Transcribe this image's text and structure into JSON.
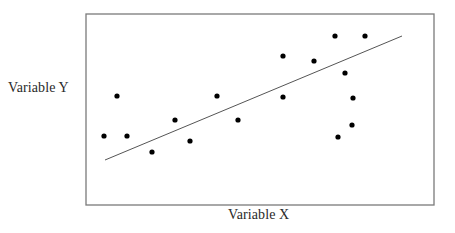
{
  "chart_data": {
    "type": "scatter",
    "title": "",
    "xlabel": "Variable X",
    "ylabel": "Variable Y",
    "xlim": [
      0,
      100
    ],
    "ylim": [
      0,
      100
    ],
    "grid": false,
    "legend": null,
    "ticks": "none",
    "series": [
      {
        "name": "observations",
        "marker": "filled-circle",
        "color": "#000000",
        "points_px": [
          [
            104,
            136
          ],
          [
            117,
            96
          ],
          [
            127,
            136
          ],
          [
            152,
            152
          ],
          [
            175,
            120
          ],
          [
            190,
            141
          ],
          [
            217,
            96
          ],
          [
            238,
            120
          ],
          [
            283,
            56
          ],
          [
            283,
            97
          ],
          [
            314,
            61
          ],
          [
            335,
            36
          ],
          [
            345,
            73
          ],
          [
            365,
            36
          ],
          [
            353,
            98
          ],
          [
            352,
            125
          ],
          [
            338,
            137
          ]
        ],
        "points": [
          {
            "x": 5,
            "y": 36
          },
          {
            "x": 9,
            "y": 57
          },
          {
            "x": 12,
            "y": 36
          },
          {
            "x": 19,
            "y": 28
          },
          {
            "x": 26,
            "y": 45
          },
          {
            "x": 30,
            "y": 34
          },
          {
            "x": 38,
            "y": 57
          },
          {
            "x": 44,
            "y": 45
          },
          {
            "x": 57,
            "y": 78
          },
          {
            "x": 57,
            "y": 57
          },
          {
            "x": 66,
            "y": 75
          },
          {
            "x": 72,
            "y": 88
          },
          {
            "x": 74,
            "y": 69
          },
          {
            "x": 80,
            "y": 88
          },
          {
            "x": 77,
            "y": 56
          },
          {
            "x": 76,
            "y": 42
          },
          {
            "x": 72,
            "y": 36
          }
        ]
      }
    ],
    "trendline": {
      "name": "linear fit",
      "color": "#555555",
      "start_px": [
        105,
        160
      ],
      "end_px": [
        402,
        36
      ],
      "start": {
        "x": 5,
        "y": 24
      },
      "end": {
        "x": 91,
        "y": 88
      }
    },
    "frame_px": {
      "left": 86,
      "top": 14,
      "right": 434,
      "bottom": 205
    }
  }
}
